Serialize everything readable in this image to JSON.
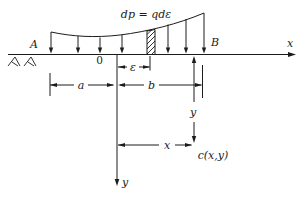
{
  "diagram": {
    "labels": {
      "load_element": "dp = qdε",
      "point_a": "A",
      "point_b": "B",
      "origin": "0",
      "axis_x": "x",
      "axis_y": "y",
      "dim_a": "a",
      "dim_b": "b",
      "dim_epsilon": "ε",
      "dim_x": "x",
      "dim_y": "y",
      "point_c": "c(x,y)"
    },
    "colors": {
      "ink": "#1c1c1c",
      "background": "#ffffff"
    }
  }
}
